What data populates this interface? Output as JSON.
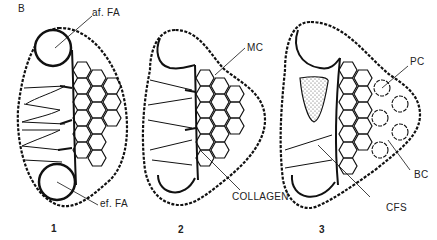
{
  "figure": {
    "panel_label": "B",
    "stages": [
      {
        "number": "1"
      },
      {
        "number": "2"
      },
      {
        "number": "3"
      }
    ],
    "labels": {
      "af_fa": "af. FA",
      "ef_fa": "ef. FA",
      "mc": "MC",
      "collagen": "COLLAGEN",
      "pc": "PC",
      "bc": "BC",
      "cfs": "CFS"
    },
    "colors": {
      "ink": "#111111",
      "background": "#ffffff",
      "stipple": "#555555"
    }
  }
}
